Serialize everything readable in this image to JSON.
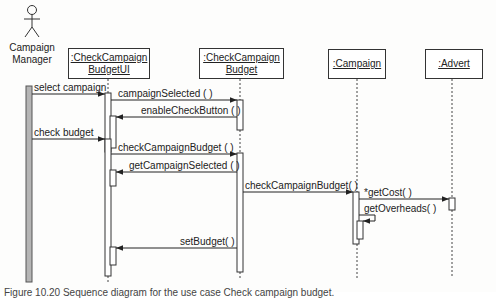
{
  "diagram": {
    "type": "UML sequence diagram",
    "actor": {
      "name_line1": "Campaign",
      "name_line2": "Manager"
    },
    "objects": [
      {
        "id": "budget_ui",
        "line1": ":CheckCampaign",
        "line2": "BudgetUI"
      },
      {
        "id": "budget",
        "line1": ":CheckCampaign",
        "line2": "Budget"
      },
      {
        "id": "campaign",
        "line1": ":Campaign",
        "line2": ""
      },
      {
        "id": "advert",
        "line1": ":Advert",
        "line2": ""
      }
    ],
    "messages": [
      {
        "from": "actor",
        "to": "budget_ui",
        "label": "select campaign"
      },
      {
        "from": "budget_ui",
        "to": "budget",
        "label": "campaignSelected ( )"
      },
      {
        "from": "budget",
        "to": "budget_ui",
        "label": "enableCheckButton ( )"
      },
      {
        "from": "actor",
        "to": "budget_ui",
        "label": "check budget"
      },
      {
        "from": "budget_ui",
        "to": "budget",
        "label": "checkCampaignBudget ( )"
      },
      {
        "from": "budget",
        "to": "budget_ui",
        "label": "getCampaignSelected ( )"
      },
      {
        "from": "budget",
        "to": "campaign",
        "label": "checkCampaignBudget( )"
      },
      {
        "from": "campaign",
        "to": "advert",
        "label": "*getCost( )"
      },
      {
        "from": "campaign",
        "to": "campaign",
        "label": "getOverheads( )"
      },
      {
        "from": "budget",
        "to": "budget_ui",
        "label": "setBudget( )"
      }
    ],
    "caption": "Figure 10.20 Sequence diagram for the use case Check campaign budget."
  }
}
